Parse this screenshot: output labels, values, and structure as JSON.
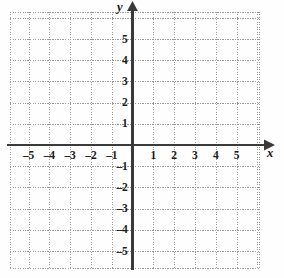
{
  "figure": {
    "title": "",
    "x_axis_name": "x",
    "y_axis_name": "y",
    "background_color": "#fefefe",
    "grid_color": "#9a9a9a",
    "axis_color": "#3a3a3a",
    "label_color": "#1b1b1b"
  },
  "chart_data": {
    "type": "scatter",
    "title": "",
    "subtitle": "",
    "xlabel": "x",
    "ylabel": "y",
    "xlim": [
      -5.9,
      6.1
    ],
    "ylim": [
      -6.2,
      5.9
    ],
    "xticks": [
      -5,
      -4,
      -3,
      -2,
      -1,
      1,
      2,
      3,
      4,
      5
    ],
    "yticks": [
      5,
      4,
      3,
      2,
      1,
      -1,
      -2,
      -3,
      -4,
      -5
    ],
    "xtick_labels": [
      "–5",
      "–4",
      "–3",
      "–2",
      "–1",
      "1",
      "2",
      "3",
      "4",
      "5"
    ],
    "ytick_labels": [
      "5",
      "4",
      "3",
      "2",
      "1",
      "–1",
      "–2",
      "–3",
      "–4",
      "–5"
    ],
    "grid": true,
    "grid_style": "dotted",
    "legend": false,
    "legend_position": "none",
    "series": [],
    "x": [],
    "y": [],
    "annotations": []
  },
  "axis_labels": {
    "x_negative": [
      "–5",
      "–4",
      "–3",
      "–2",
      "–1"
    ],
    "x_positive": [
      "1",
      "2",
      "3",
      "4",
      "5"
    ],
    "y_positive": [
      "5",
      "4",
      "3",
      "2",
      "1"
    ],
    "y_negative": [
      "–1",
      "–2",
      "–3",
      "–4",
      "–5"
    ]
  }
}
